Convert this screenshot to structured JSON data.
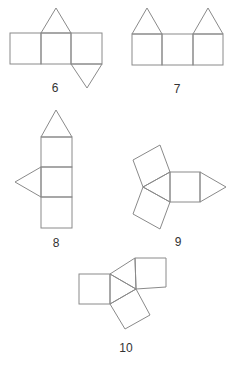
{
  "figures": [
    {
      "id": "6",
      "label": "6",
      "description": "Net: three squares in a row, triangle on top of middle square, triangle below right square"
    },
    {
      "id": "7",
      "label": "7",
      "description": "Net: three squares in a row, triangles on top of left and right squares"
    },
    {
      "id": "8",
      "label": "8",
      "description": "Net: three squares stacked vertically, triangle on top, triangle on left of middle square"
    },
    {
      "id": "9",
      "label": "9",
      "description": "Net: central square with triangle on right, triangle on left with two squares attached to its other sides"
    },
    {
      "id": "10",
      "label": "10",
      "description": "Net: central triangle with three squares attached to each side"
    }
  ],
  "colors": {
    "stroke": "#8a8a8a",
    "text": "#333333",
    "background": "#ffffff"
  }
}
